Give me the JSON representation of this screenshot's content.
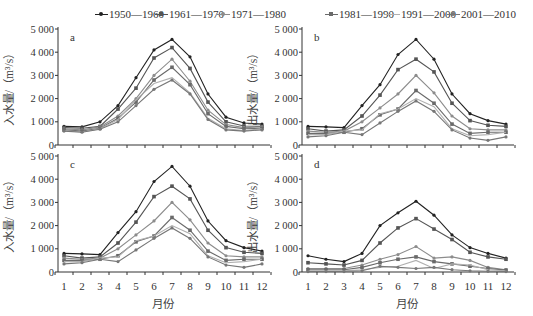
{
  "legend": [
    {
      "label": "1950—1960",
      "color": "#222222",
      "marker": "dot"
    },
    {
      "label": "1961—1970",
      "color": "#555555",
      "marker": "square"
    },
    {
      "label": "1971—1980",
      "color": "#8c8c8c",
      "marker": "dot"
    },
    {
      "label": "1981—1990",
      "color": "#6a6a6a",
      "marker": "square"
    },
    {
      "label": "1991—2000",
      "color": "#b0b0b0",
      "marker": "none"
    },
    {
      "label": "2001—2010",
      "color": "#777777",
      "marker": "dot"
    }
  ],
  "xlabel": "月份",
  "ylabel_in": "入水量/（m³/s）",
  "ylabel_out": "出水量/（m³/s）",
  "chart_data": [
    {
      "type": "line",
      "panel": "a",
      "title": "a",
      "xlabel": "",
      "ylabel": "入水量/（m³/s）",
      "x": [
        1,
        2,
        3,
        4,
        5,
        6,
        7,
        8,
        9,
        10,
        11,
        12
      ],
      "yticks": [
        "0",
        "1 000",
        "2 000",
        "3 000",
        "4 000",
        "5 000"
      ],
      "ylim": [
        0,
        5000
      ],
      "grid": false,
      "legend_position": "top",
      "series": [
        {
          "name": "1950—1960",
          "values": [
            800,
            780,
            1000,
            1700,
            2900,
            4100,
            4550,
            3800,
            2200,
            1200,
            950,
            900
          ]
        },
        {
          "name": "1961—1970",
          "values": [
            750,
            720,
            800,
            1550,
            2450,
            3750,
            4200,
            3300,
            1850,
            1000,
            820,
            800
          ]
        },
        {
          "name": "1971—1980",
          "values": [
            700,
            650,
            780,
            1250,
            2000,
            3000,
            3700,
            2750,
            1500,
            880,
            750,
            780
          ]
        },
        {
          "name": "1981—1990",
          "values": [
            650,
            600,
            720,
            1150,
            1850,
            2800,
            3350,
            2600,
            1350,
            800,
            700,
            720
          ]
        },
        {
          "name": "1991—2000",
          "values": [
            620,
            560,
            700,
            1100,
            1950,
            2650,
            2900,
            2250,
            1150,
            700,
            620,
            700
          ]
        },
        {
          "name": "2001—2010",
          "values": [
            600,
            550,
            680,
            1000,
            1700,
            2400,
            2800,
            2200,
            1100,
            650,
            600,
            650
          ]
        }
      ]
    },
    {
      "type": "line",
      "panel": "b",
      "title": "b",
      "xlabel": "",
      "ylabel": "出水量/（m³/s）",
      "x": [
        1,
        2,
        3,
        4,
        5,
        6,
        7,
        8,
        9,
        10,
        11,
        12
      ],
      "yticks": [
        "0",
        "1 000",
        "2 000",
        "3 000",
        "4 000",
        "5 000"
      ],
      "ylim": [
        0,
        5000
      ],
      "grid": false,
      "series": [
        {
          "name": "1950—1960",
          "values": [
            800,
            780,
            750,
            1700,
            2600,
            3900,
            4550,
            3700,
            2200,
            1350,
            1050,
            900
          ]
        },
        {
          "name": "1961—1970",
          "values": [
            700,
            600,
            650,
            1250,
            2150,
            3250,
            3700,
            3150,
            1800,
            1050,
            850,
            800
          ]
        },
        {
          "name": "1971—1980",
          "values": [
            600,
            550,
            600,
            1000,
            1600,
            2200,
            3000,
            2250,
            1250,
            700,
            650,
            650
          ]
        },
        {
          "name": "1981—1990",
          "values": [
            500,
            500,
            550,
            700,
            1300,
            1550,
            2350,
            1800,
            900,
            500,
            550,
            550
          ]
        },
        {
          "name": "1991—2000",
          "values": [
            450,
            450,
            600,
            650,
            1350,
            1550,
            2000,
            1650,
            700,
            400,
            450,
            550
          ]
        },
        {
          "name": "2001—2010",
          "values": [
            350,
            400,
            550,
            450,
            950,
            1450,
            1900,
            1450,
            650,
            300,
            200,
            350
          ]
        }
      ]
    },
    {
      "type": "line",
      "panel": "c",
      "title": "c",
      "xlabel": "月份",
      "ylabel": "入水量/（m³/s）",
      "x": [
        1,
        2,
        3,
        4,
        5,
        6,
        7,
        8,
        9,
        10,
        11,
        12
      ],
      "yticks": [
        "0",
        "1 000",
        "2 000",
        "3 000",
        "4 000",
        "5 000"
      ],
      "ylim": [
        0,
        5000
      ],
      "grid": false,
      "series": [
        {
          "name": "1950—1960",
          "values": [
            800,
            780,
            750,
            1700,
            2600,
            3900,
            4550,
            3700,
            2200,
            1350,
            1050,
            900
          ]
        },
        {
          "name": "1961—1970",
          "values": [
            700,
            600,
            650,
            1250,
            2150,
            3250,
            3700,
            3150,
            1800,
            1050,
            850,
            800
          ]
        },
        {
          "name": "1971—1980",
          "values": [
            600,
            550,
            600,
            1000,
            1600,
            2200,
            3000,
            2250,
            1250,
            700,
            650,
            650
          ]
        },
        {
          "name": "1981—1990",
          "values": [
            500,
            500,
            550,
            700,
            1300,
            1550,
            2350,
            1800,
            900,
            500,
            550,
            550
          ]
        },
        {
          "name": "1991—2000",
          "values": [
            450,
            450,
            600,
            650,
            1350,
            1550,
            2000,
            1650,
            700,
            400,
            450,
            550
          ]
        },
        {
          "name": "2001—2010",
          "values": [
            350,
            400,
            550,
            450,
            950,
            1450,
            1900,
            1450,
            650,
            300,
            200,
            350
          ]
        }
      ]
    },
    {
      "type": "line",
      "panel": "d",
      "title": "d",
      "xlabel": "月份",
      "ylabel": "出水量/（m³/s）",
      "x": [
        1,
        2,
        3,
        4,
        5,
        6,
        7,
        8,
        9,
        10,
        11,
        12
      ],
      "yticks": [
        "0",
        "1 000",
        "2 000",
        "3 000",
        "4 000",
        "5 000"
      ],
      "ylim": [
        0,
        5000
      ],
      "grid": false,
      "series": [
        {
          "name": "1950—1960",
          "values": [
            700,
            550,
            450,
            800,
            2000,
            2550,
            3050,
            2450,
            1600,
            1050,
            800,
            600
          ]
        },
        {
          "name": "1961—1970",
          "values": [
            400,
            350,
            300,
            500,
            1250,
            1900,
            2300,
            1850,
            1400,
            850,
            650,
            550
          ]
        },
        {
          "name": "1971—1980",
          "values": [
            150,
            150,
            150,
            300,
            550,
            750,
            1100,
            600,
            650,
            500,
            200,
            100
          ]
        },
        {
          "name": "1981—1990",
          "values": [
            100,
            100,
            100,
            200,
            400,
            550,
            650,
            450,
            350,
            250,
            150,
            80
          ]
        },
        {
          "name": "1991—2000",
          "values": [
            50,
            50,
            50,
            100,
            200,
            250,
            500,
            150,
            350,
            300,
            100,
            50
          ]
        },
        {
          "name": "2001—2010",
          "values": [
            20,
            20,
            20,
            50,
            250,
            200,
            150,
            200,
            100,
            50,
            30,
            20
          ]
        }
      ]
    }
  ]
}
